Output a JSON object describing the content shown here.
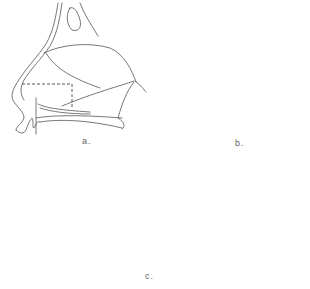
{
  "figure": {
    "panels": [
      {
        "id": "a",
        "label": "a.",
        "view": "lateral nasal view with dashed excision outline"
      },
      {
        "id": "b",
        "label": "b.",
        "view": "lateral nasal view with sutured graft"
      },
      {
        "id": "c",
        "label": "c.",
        "view": "basal nasal view with columellar strut and sutures"
      }
    ],
    "line_color": "#555555",
    "strut_color": "#d8d8d8"
  }
}
